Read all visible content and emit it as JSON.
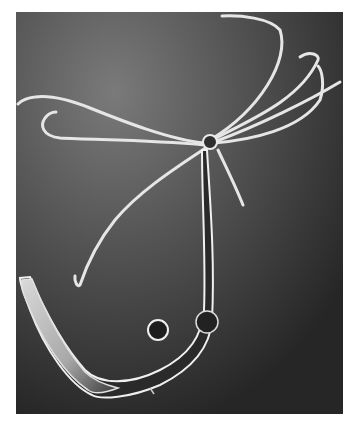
{
  "image": {
    "subject": "Hydra with tentacles and two buds",
    "style": "black-and-white photograph",
    "colors": {
      "background_light": "#6e6e6e",
      "background_dark": "#262626",
      "tentacle": "#e8e8e8",
      "body_dark": "#2a2a2a",
      "body_outline": "#f0f0f0"
    }
  }
}
